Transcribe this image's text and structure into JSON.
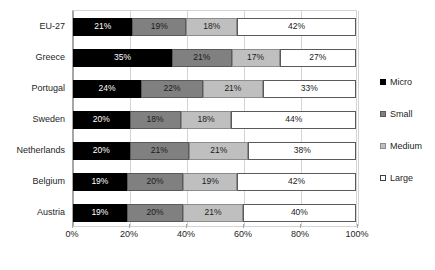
{
  "chart_data": {
    "type": "bar",
    "orientation": "horizontal",
    "stacked": true,
    "stack_mode": "percent",
    "title": "",
    "subtitle": "",
    "xlabel": "",
    "ylabel": "",
    "xlim": [
      0,
      100
    ],
    "xticks": [
      0,
      20,
      40,
      60,
      80,
      100
    ],
    "xtick_labels": [
      "0%",
      "20%",
      "40%",
      "60%",
      "80%",
      "100%"
    ],
    "grid": true,
    "grid_axis": "x",
    "legend_position": "right",
    "value_label_suffix": "%",
    "categories": [
      "EU-27",
      "Greece",
      "Portugal",
      "Sweden",
      "Netherlands",
      "Belgium",
      "Austria"
    ],
    "series": [
      {
        "name": "Micro",
        "color": "#000000",
        "values": [
          21,
          35,
          24,
          20,
          20,
          19,
          19
        ]
      },
      {
        "name": "Small",
        "color": "#808080",
        "values": [
          19,
          21,
          22,
          18,
          21,
          20,
          20
        ]
      },
      {
        "name": "Medium",
        "color": "#bfbfbf",
        "values": [
          18,
          17,
          21,
          18,
          21,
          19,
          21
        ]
      },
      {
        "name": "Large",
        "color": "#ffffff",
        "values": [
          42,
          27,
          33,
          44,
          38,
          42,
          40
        ]
      }
    ],
    "rows": [
      {
        "category": "EU-27",
        "segments": [
          {
            "series": "Micro",
            "value": 21,
            "label": "21%"
          },
          {
            "series": "Small",
            "value": 19,
            "label": "19%"
          },
          {
            "series": "Medium",
            "value": 18,
            "label": "18%"
          },
          {
            "series": "Large",
            "value": 42,
            "label": "42%"
          }
        ]
      },
      {
        "category": "Greece",
        "segments": [
          {
            "series": "Micro",
            "value": 35,
            "label": "35%"
          },
          {
            "series": "Small",
            "value": 21,
            "label": "21%"
          },
          {
            "series": "Medium",
            "value": 17,
            "label": "17%"
          },
          {
            "series": "Large",
            "value": 27,
            "label": "27%"
          }
        ]
      },
      {
        "category": "Portugal",
        "segments": [
          {
            "series": "Micro",
            "value": 24,
            "label": "24%"
          },
          {
            "series": "Small",
            "value": 22,
            "label": "22%"
          },
          {
            "series": "Medium",
            "value": 21,
            "label": "21%"
          },
          {
            "series": "Large",
            "value": 33,
            "label": "33%"
          }
        ]
      },
      {
        "category": "Sweden",
        "segments": [
          {
            "series": "Micro",
            "value": 20,
            "label": "20%"
          },
          {
            "series": "Small",
            "value": 18,
            "label": "18%"
          },
          {
            "series": "Medium",
            "value": 18,
            "label": "18%"
          },
          {
            "series": "Large",
            "value": 44,
            "label": "44%"
          }
        ]
      },
      {
        "category": "Netherlands",
        "segments": [
          {
            "series": "Micro",
            "value": 20,
            "label": "20%"
          },
          {
            "series": "Small",
            "value": 21,
            "label": "21%"
          },
          {
            "series": "Medium",
            "value": 21,
            "label": "21%"
          },
          {
            "series": "Large",
            "value": 38,
            "label": "38%"
          }
        ]
      },
      {
        "category": "Belgium",
        "segments": [
          {
            "series": "Micro",
            "value": 19,
            "label": "19%"
          },
          {
            "series": "Small",
            "value": 20,
            "label": "20%"
          },
          {
            "series": "Medium",
            "value": 19,
            "label": "19%"
          },
          {
            "series": "Large",
            "value": 42,
            "label": "42%"
          }
        ]
      },
      {
        "category": "Austria",
        "segments": [
          {
            "series": "Micro",
            "value": 19,
            "label": "19%"
          },
          {
            "series": "Small",
            "value": 20,
            "label": "20%"
          },
          {
            "series": "Medium",
            "value": 21,
            "label": "21%"
          },
          {
            "series": "Large",
            "value": 40,
            "label": "40%"
          }
        ]
      }
    ],
    "legend": [
      {
        "label": "Micro",
        "color": "#000000"
      },
      {
        "label": "Small",
        "color": "#808080"
      },
      {
        "label": "Medium",
        "color": "#bfbfbf"
      },
      {
        "label": "Large",
        "color": "#ffffff"
      }
    ]
  }
}
